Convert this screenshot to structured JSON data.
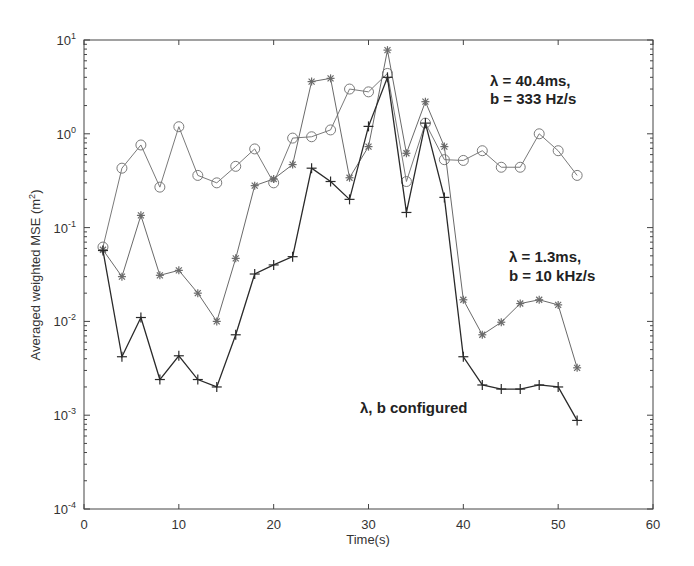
{
  "chart_data": {
    "type": "line",
    "title": "",
    "xlabel": "Time(s)",
    "ylabel": "Averaged weighted MSE (m²)",
    "xlim": [
      0,
      60
    ],
    "ylim": [
      0.0001,
      10
    ],
    "yscale": "log",
    "xticks": [
      0,
      10,
      20,
      30,
      40,
      50,
      60
    ],
    "yticks": [
      "10^-4",
      "10^-3",
      "10^-2",
      "10^-1",
      "10^0",
      "10^1"
    ],
    "grid": false,
    "legend": "none (inline annotations)",
    "x": [
      2,
      4,
      6,
      8,
      10,
      12,
      14,
      16,
      18,
      20,
      22,
      24,
      26,
      28,
      30,
      32,
      34,
      36,
      38,
      40,
      42,
      44,
      46,
      48,
      50,
      52
    ],
    "series": [
      {
        "name": "λ = 40.4ms, b = 333 Hz/s",
        "marker": "circle",
        "values": [
          0.062,
          0.43,
          0.76,
          0.27,
          1.19,
          0.36,
          0.3,
          0.45,
          0.69,
          0.3,
          0.9,
          0.93,
          1.1,
          3.0,
          2.8,
          4.4,
          0.31,
          1.3,
          0.53,
          0.52,
          0.66,
          0.44,
          0.44,
          1.0,
          0.66,
          0.36
        ]
      },
      {
        "name": "λ = 1.3ms, b = 10 kHz/s",
        "marker": "star",
        "values": [
          0.058,
          0.03,
          0.135,
          0.031,
          0.035,
          0.02,
          0.01,
          0.047,
          0.28,
          0.33,
          0.47,
          3.6,
          3.9,
          0.34,
          0.73,
          7.8,
          0.62,
          2.2,
          0.73,
          0.017,
          0.0072,
          0.0098,
          0.0155,
          0.017,
          0.015,
          0.0032
        ]
      },
      {
        "name": "λ, b configured",
        "marker": "plus",
        "values": [
          0.057,
          0.0042,
          0.011,
          0.0024,
          0.0043,
          0.0024,
          0.002,
          0.0072,
          0.032,
          0.04,
          0.049,
          0.43,
          0.31,
          0.2,
          1.2,
          4.0,
          0.145,
          1.3,
          0.21,
          0.0042,
          0.0021,
          0.0019,
          0.0019,
          0.0021,
          0.002,
          0.00088
        ]
      }
    ],
    "annotations": [
      {
        "line1": "λ = 40.4ms,",
        "line2": "b = 333 Hz/s"
      },
      {
        "line1": "λ = 1.3ms,",
        "line2": "b = 10 kHz/s"
      },
      {
        "line1": "λ, b configured",
        "line2": ""
      }
    ]
  },
  "labels": {
    "xlabel": "Time(s)",
    "ylabel_main": "Averaged weighted MSE (m",
    "ylabel_sup": "2",
    "ylabel_end": ")",
    "annot1_l1": "λ = 40.4ms,",
    "annot1_l2": "b = 333 Hz/s",
    "annot2_l1": "λ = 1.3ms,",
    "annot2_l2": "b = 10 kHz/s",
    "annot3": "λ, b configured"
  },
  "colors": {
    "circle_series": "#7a7a7a",
    "star_series": "#6a6a6a",
    "plus_series": "#2a2a2a",
    "axis": "#444444"
  }
}
